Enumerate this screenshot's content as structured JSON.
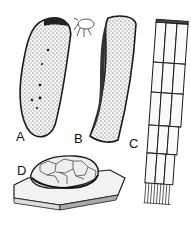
{
  "figure": {
    "panels": [
      {
        "id": "A",
        "label": "A",
        "description": "Elongated stippled oval body with dark spots"
      },
      {
        "id": "B",
        "label": "B",
        "description": "Curved horn-shaped stippled tube"
      },
      {
        "id": "C",
        "label": "C",
        "description": "Column of stacked elongated cells"
      },
      {
        "id": "D",
        "label": "D",
        "description": "Cluster of polygonal cells resting on a slab"
      }
    ],
    "colors": {
      "ink": "#1a1a1a",
      "paper": "#ffffff",
      "stipple": "#555555"
    }
  }
}
